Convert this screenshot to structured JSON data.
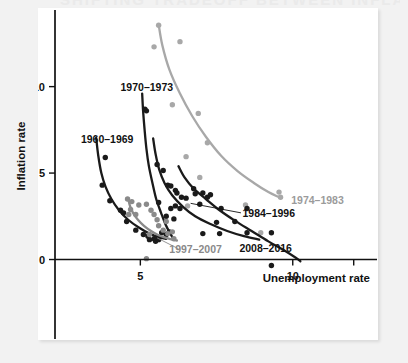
{
  "figure": {
    "background_color": "#f2f2f2",
    "panel_color": "#ffffff",
    "bleed_heading": "SHIFTING TRADEOFF BETWEEN INFLATION AND UNEMPLOYMENT"
  },
  "chart_data": {
    "type": "scatter",
    "title": "",
    "subtitle": "",
    "xlabel": "Unemployment rate",
    "ylabel": "Inflation rate",
    "xlim": [
      2.2,
      12.6
    ],
    "ylim": [
      -1.3,
      14.2
    ],
    "xticks": [
      5,
      10
    ],
    "xtick_labels": [
      "5",
      "10"
    ],
    "xticks_unlabeled": [
      12
    ],
    "yticks": [
      0,
      5,
      10
    ],
    "ytick_labels": [
      "0",
      "5",
      "10"
    ],
    "grid": false,
    "legend": "inline-annotations",
    "colors": {
      "dark": "#1a1a1a",
      "mid_gray": "#8a8a8a",
      "light_gray": "#a8a8a8",
      "axis": "#111111"
    },
    "series": [
      {
        "name": "1960–1969",
        "label": "1960–1969",
        "color": "#1a1a1a",
        "label_color": "#111111",
        "label_x": 3.05,
        "label_y": 6.75,
        "label_anchor": "start",
        "fit_curve": [
          [
            3.55,
            7.05
          ],
          [
            3.62,
            6.0
          ],
          [
            3.72,
            5.0
          ],
          [
            3.86,
            4.2
          ],
          [
            4.05,
            3.5
          ],
          [
            4.3,
            2.85
          ],
          [
            4.6,
            2.3
          ],
          [
            4.95,
            1.85
          ],
          [
            5.3,
            1.5
          ],
          [
            5.6,
            1.3
          ],
          [
            5.85,
            1.2
          ]
        ],
        "points": [
          [
            3.85,
            5.9
          ],
          [
            3.75,
            4.3
          ],
          [
            4.0,
            3.4
          ],
          [
            4.35,
            2.85
          ],
          [
            4.45,
            2.7
          ],
          [
            4.55,
            2.2
          ],
          [
            4.85,
            1.7
          ],
          [
            5.1,
            1.45
          ],
          [
            5.25,
            1.35
          ],
          [
            5.45,
            1.2
          ],
          [
            5.5,
            1.05
          ],
          [
            5.6,
            1.15
          ],
          [
            5.3,
            1.15
          ],
          [
            5.55,
            1.3
          ],
          [
            5.7,
            1.55
          ]
        ]
      },
      {
        "name": "1970–1973",
        "label": "1970–1973",
        "color": "#1a1a1a",
        "label_color": "#111111",
        "label_x": 4.35,
        "label_y": 9.75,
        "label_anchor": "start",
        "fit_curve": [
          [
            5.06,
            9.6
          ],
          [
            5.09,
            8.6
          ],
          [
            5.14,
            7.5
          ],
          [
            5.2,
            6.4
          ],
          [
            5.28,
            5.4
          ],
          [
            5.4,
            4.4
          ],
          [
            5.52,
            3.5
          ],
          [
            5.68,
            2.7
          ],
          [
            5.82,
            2.05
          ],
          [
            5.95,
            1.6
          ],
          [
            6.05,
            1.3
          ]
        ],
        "points": [
          [
            5.15,
            8.7
          ],
          [
            5.2,
            8.6
          ],
          [
            5.6,
            3.3
          ],
          [
            5.95,
            1.6
          ],
          [
            5.85,
            1.45
          ]
        ]
      },
      {
        "name": "1974–1983",
        "label": "1974–1983",
        "color": "#a8a8a8",
        "label_color": "#9b9b9b",
        "label_x": 9.95,
        "label_y": 3.2,
        "label_anchor": "start",
        "fit_curve": [
          [
            5.6,
            13.6
          ],
          [
            5.72,
            12.4
          ],
          [
            5.95,
            11.0
          ],
          [
            6.3,
            9.6
          ],
          [
            6.7,
            8.3
          ],
          [
            7.15,
            7.1
          ],
          [
            7.65,
            6.0
          ],
          [
            8.2,
            5.1
          ],
          [
            8.75,
            4.4
          ],
          [
            9.2,
            3.9
          ],
          [
            9.55,
            3.6
          ]
        ],
        "points": [
          [
            5.45,
            12.3
          ],
          [
            5.6,
            13.55
          ],
          [
            6.3,
            12.6
          ],
          [
            6.05,
            8.95
          ],
          [
            6.9,
            8.45
          ],
          [
            6.5,
            5.95
          ],
          [
            7.2,
            6.75
          ],
          [
            6.95,
            4.75
          ],
          [
            6.55,
            3.1
          ],
          [
            8.45,
            3.15
          ],
          [
            9.55,
            3.9
          ],
          [
            9.6,
            3.6
          ],
          [
            8.95,
            1.55
          ]
        ]
      },
      {
        "name": "1984–1996",
        "label": "1984–1996",
        "color": "#1a1a1a",
        "label_color": "#111111",
        "label_x": 8.35,
        "label_y": 2.45,
        "label_anchor": "start",
        "leader_line": [
          [
            8.3,
            2.7
          ],
          [
            6.65,
            3.25
          ]
        ],
        "fit_curve": [
          [
            5.42,
            7.0
          ],
          [
            5.5,
            6.1
          ],
          [
            5.62,
            5.2
          ],
          [
            5.8,
            4.4
          ],
          [
            6.05,
            3.7
          ],
          [
            6.4,
            3.05
          ],
          [
            6.8,
            2.5
          ],
          [
            7.3,
            2.05
          ],
          [
            7.85,
            1.65
          ],
          [
            8.4,
            1.35
          ],
          [
            8.9,
            1.15
          ]
        ],
        "points": [
          [
            5.55,
            5.5
          ],
          [
            5.75,
            5.15
          ],
          [
            5.9,
            4.3
          ],
          [
            6.0,
            4.25
          ],
          [
            6.15,
            4.0
          ],
          [
            6.2,
            3.85
          ],
          [
            6.35,
            3.6
          ],
          [
            6.5,
            3.55
          ],
          [
            6.75,
            4.1
          ],
          [
            7.05,
            3.85
          ],
          [
            7.2,
            3.6
          ],
          [
            6.95,
            3.2
          ],
          [
            6.3,
            2.95
          ],
          [
            6.0,
            2.95
          ],
          [
            5.85,
            2.5
          ],
          [
            6.1,
            2.35
          ],
          [
            7.5,
            2.15
          ],
          [
            7.05,
            1.5
          ],
          [
            8.5,
            1.55
          ],
          [
            6.15,
            3.1
          ]
        ]
      },
      {
        "name": "1997–2007",
        "label": "1997–2007",
        "color": "#8a8a8a",
        "label_color": "#8a8a8a",
        "label_x": 5.95,
        "label_y": 0.35,
        "label_anchor": "start",
        "leader_line": [
          [
            6.25,
            0.62
          ],
          [
            5.55,
            1.25
          ]
        ],
        "fit_curve": [
          [
            4.6,
            3.55
          ],
          [
            4.66,
            3.1
          ],
          [
            4.76,
            2.7
          ],
          [
            4.92,
            2.3
          ],
          [
            5.12,
            1.95
          ],
          [
            5.35,
            1.65
          ],
          [
            5.6,
            1.4
          ],
          [
            5.85,
            1.25
          ],
          [
            6.05,
            1.15
          ],
          [
            6.2,
            1.1
          ]
        ],
        "points": [
          [
            4.58,
            3.5
          ],
          [
            4.72,
            3.35
          ],
          [
            4.68,
            2.9
          ],
          [
            4.62,
            2.6
          ],
          [
            4.85,
            2.6
          ],
          [
            4.95,
            3.15
          ],
          [
            5.2,
            3.2
          ],
          [
            5.35,
            2.85
          ],
          [
            5.45,
            2.6
          ],
          [
            5.55,
            2.3
          ],
          [
            5.6,
            1.95
          ],
          [
            5.75,
            1.7
          ],
          [
            5.9,
            1.5
          ],
          [
            5.85,
            2.2
          ],
          [
            6.05,
            1.6
          ],
          [
            6.1,
            1.2
          ],
          [
            5.3,
            1.45
          ],
          [
            5.2,
            0.05
          ]
        ]
      },
      {
        "name": "2008–2016",
        "label": "2008–2016",
        "color": "#1a1a1a",
        "label_color": "#111111",
        "label_x": 8.25,
        "label_y": 0.45,
        "label_anchor": "start",
        "fit_curve": [
          [
            6.25,
            5.4
          ],
          [
            6.45,
            4.75
          ],
          [
            6.75,
            4.1
          ],
          [
            7.15,
            3.5
          ],
          [
            7.6,
            2.85
          ],
          [
            8.1,
            2.25
          ],
          [
            8.65,
            1.65
          ],
          [
            9.2,
            1.05
          ],
          [
            9.7,
            0.55
          ],
          [
            10.1,
            0.1
          ],
          [
            10.25,
            -0.1
          ]
        ],
        "points": [
          [
            6.8,
            3.8
          ],
          [
            7.3,
            3.75
          ],
          [
            7.65,
            2.95
          ],
          [
            8.5,
            2.95
          ],
          [
            9.3,
            1.55
          ],
          [
            7.6,
            1.5
          ],
          [
            9.3,
            -0.35
          ],
          [
            8.1,
            2.2
          ]
        ]
      }
    ]
  }
}
